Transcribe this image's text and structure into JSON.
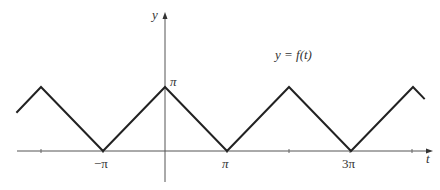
{
  "chart_data": {
    "type": "line",
    "title": "",
    "function_label": "y = f(t)",
    "xlabel": "t",
    "ylabel": "y",
    "x_tick_labels": [
      {
        "value": -3.14159,
        "label": "−π"
      },
      {
        "value": 3.14159,
        "label": "π"
      },
      {
        "value": 9.42478,
        "label": "3π"
      }
    ],
    "y_tick_labels": [
      {
        "value": 3.14159,
        "label": "π"
      }
    ],
    "unlabeled_x_ticks": [
      -6.28319,
      6.28319,
      12.56637
    ],
    "series": [
      {
        "name": "f(t)",
        "description": "triangle wave, period 2π, min 0 at odd multiples of π, max π at even multiples of π",
        "x": [
          -7.53,
          -6.28319,
          -3.14159,
          0,
          3.14159,
          6.28319,
          9.42478,
          12.56637,
          13.16
        ],
        "y": [
          1.88,
          3.14159,
          0,
          3.14159,
          0,
          3.14159,
          0,
          3.14159,
          2.55
        ]
      }
    ],
    "xlim": [
      -7.53,
      13.4
    ],
    "ylim": [
      -0.3,
      7.0
    ],
    "grid": false,
    "legend": "none",
    "colors": {
      "curve": "#222222",
      "axes": "#555555",
      "text": "#333333"
    }
  },
  "labels": {
    "y_axis": "y",
    "t_axis": "t",
    "pi_y": "π",
    "neg_pi": "−π",
    "pi": "π",
    "three_pi": "3π",
    "function": "y = f(t)"
  }
}
